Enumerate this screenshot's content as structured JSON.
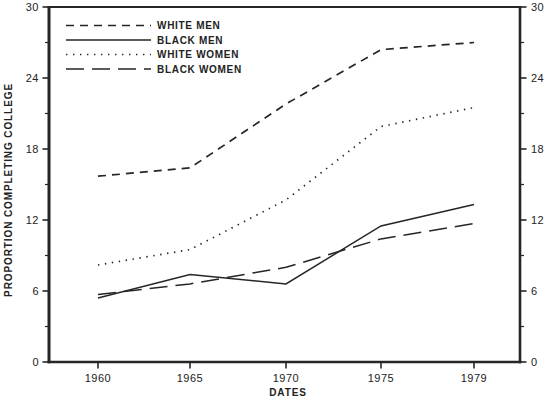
{
  "figure": {
    "background": "#ffffff",
    "ink": "#262626"
  },
  "chart_data": {
    "type": "line",
    "title": "",
    "xlabel": "DATES",
    "ylabel": "PROPORTION COMPLETING COLLEGE",
    "categories": [
      "1960",
      "1965",
      "1970",
      "1975",
      "1979"
    ],
    "ylim": [
      0,
      30
    ],
    "yticks": [
      0,
      6,
      12,
      18,
      24,
      30
    ],
    "yticks_minor": [
      3,
      9,
      15,
      21,
      27
    ],
    "grid": false,
    "legend_position": "top-left-inside",
    "series": [
      {
        "name": "WHITE MEN",
        "style": "dash-short",
        "values": [
          15.7,
          16.4,
          21.8,
          26.4,
          27.0
        ]
      },
      {
        "name": "BLACK MEN",
        "style": "solid",
        "values": [
          5.4,
          7.4,
          6.6,
          11.5,
          13.3
        ]
      },
      {
        "name": "WHITE WOMEN",
        "style": "dotted",
        "values": [
          8.2,
          9.5,
          13.7,
          19.9,
          21.5
        ]
      },
      {
        "name": "BLACK WOMEN",
        "style": "dash-long",
        "values": [
          5.7,
          6.6,
          8.0,
          10.4,
          11.7
        ]
      }
    ]
  }
}
